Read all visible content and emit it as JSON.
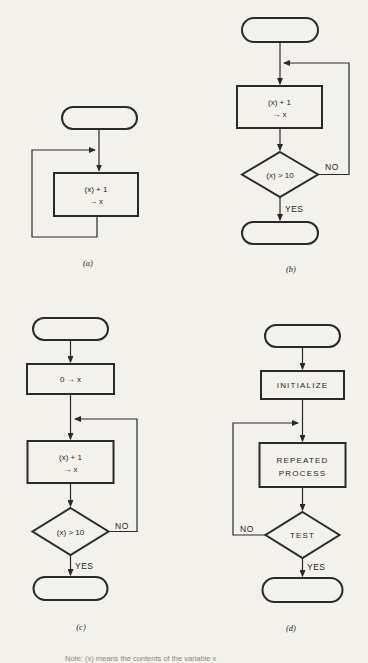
{
  "figure": {
    "background": "#f3f1ec",
    "ink": "#2a2a2a",
    "caption": "Note: (x) means the contents of the variable x",
    "charts": {
      "a": {
        "label": "(a)",
        "process": {
          "line1": "(x) + 1",
          "line2": "→ x"
        }
      },
      "b": {
        "label": "(b)",
        "process": {
          "line1": "(x) + 1",
          "line2": "→ x"
        },
        "decision": "(x) > 10",
        "no": "NO",
        "yes": "YES"
      },
      "c": {
        "label": "(c)",
        "init": "0 → x",
        "process": {
          "line1": "(x) + 1",
          "line2": "→ x"
        },
        "decision": "(x) > 10",
        "no": "NO",
        "yes": "YES"
      },
      "d": {
        "label": "(d)",
        "init": "INITIALIZE",
        "process": {
          "line1": "REPEATED",
          "line2": "PROCESS"
        },
        "decision": "TEST",
        "no": "NO",
        "yes": "YES"
      }
    }
  }
}
